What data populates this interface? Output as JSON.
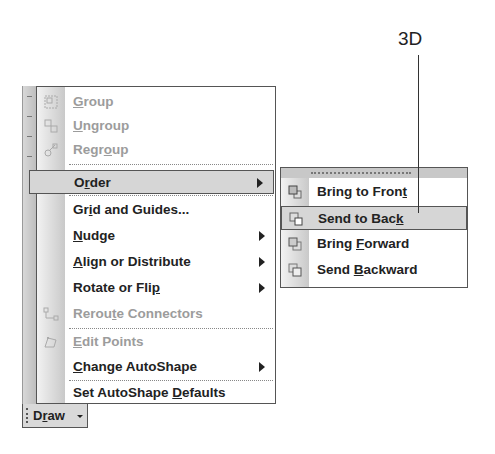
{
  "callout": {
    "label": "3D"
  },
  "draw_button": {
    "label_pre": "D",
    "label_mnemonic": "r",
    "label_post": "aw"
  },
  "menu": {
    "items": [
      {
        "pre": "",
        "mn": "G",
        "post": "roup",
        "disabled": true,
        "icon": "group-icon"
      },
      {
        "pre": "",
        "mn": "U",
        "post": "ngroup",
        "disabled": true,
        "icon": "ungroup-icon"
      },
      {
        "pre": "Regr",
        "mn": "o",
        "post": "up",
        "disabled": true,
        "icon": "regroup-icon"
      },
      {
        "pre": "O",
        "mn": "r",
        "post": "der",
        "highlighted": true,
        "submenu": true
      },
      {
        "pre": "Gr",
        "mn": "i",
        "post": "d and Guides..."
      },
      {
        "pre": "",
        "mn": "N",
        "post": "udge",
        "submenu": true
      },
      {
        "pre": "",
        "mn": "A",
        "post": "lign or Distribute",
        "submenu": true
      },
      {
        "pre": "Rotate or Fli",
        "mn": "p",
        "post": "",
        "submenu": true
      },
      {
        "pre": "Rerou",
        "mn": "t",
        "post": "e Connectors",
        "disabled": true,
        "icon": "reroute-connectors-icon"
      },
      {
        "pre": "",
        "mn": "E",
        "post": "dit Points",
        "disabled": true,
        "icon": "edit-points-icon"
      },
      {
        "pre": "",
        "mn": "C",
        "post": "hange AutoShape",
        "submenu": true
      },
      {
        "pre": "Set AutoShape ",
        "mn": "D",
        "post": "efaults"
      }
    ]
  },
  "submenu": {
    "items": [
      {
        "pre": "Bring to Fron",
        "mn": "t",
        "post": "",
        "icon": "bring-to-front-icon"
      },
      {
        "pre": "Send to Bac",
        "mn": "k",
        "post": "",
        "icon": "send-to-back-icon",
        "highlighted": true
      },
      {
        "pre": "Bring ",
        "mn": "F",
        "post": "orward",
        "icon": "bring-forward-icon"
      },
      {
        "pre": "Send ",
        "mn": "B",
        "post": "ackward",
        "icon": "send-backward-icon"
      }
    ]
  }
}
